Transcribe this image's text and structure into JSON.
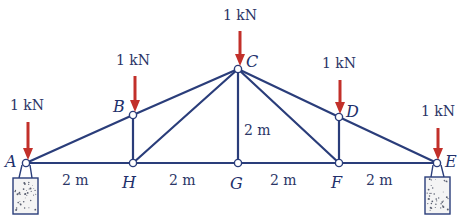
{
  "diagram": {
    "type": "truss",
    "line_color": "#2a3d7a",
    "load_color": "#c2302a",
    "joints": [
      {
        "id": "A",
        "label": "A",
        "x": 26,
        "y": 163,
        "lx": 5,
        "ly": 167
      },
      {
        "id": "B",
        "label": "B",
        "x": 133,
        "y": 115,
        "lx": 113,
        "ly": 112
      },
      {
        "id": "C",
        "label": "C",
        "x": 238,
        "y": 69,
        "lx": 246,
        "ly": 67
      },
      {
        "id": "D",
        "label": "D",
        "x": 339,
        "y": 117,
        "lx": 346,
        "ly": 117
      },
      {
        "id": "E",
        "label": "E",
        "x": 437,
        "y": 163,
        "lx": 445,
        "ly": 167
      },
      {
        "id": "F",
        "label": "F",
        "x": 339,
        "y": 163,
        "lx": 331,
        "ly": 188
      },
      {
        "id": "G",
        "label": "G",
        "x": 238,
        "y": 163,
        "lx": 230,
        "ly": 189
      },
      {
        "id": "H",
        "label": "H",
        "x": 133,
        "y": 163,
        "lx": 122,
        "ly": 188
      }
    ],
    "members": [
      [
        "A",
        "B"
      ],
      [
        "B",
        "C"
      ],
      [
        "C",
        "D"
      ],
      [
        "D",
        "E"
      ],
      [
        "A",
        "H"
      ],
      [
        "H",
        "G"
      ],
      [
        "G",
        "F"
      ],
      [
        "F",
        "E"
      ],
      [
        "B",
        "H"
      ],
      [
        "H",
        "C"
      ],
      [
        "C",
        "G"
      ],
      [
        "C",
        "F"
      ],
      [
        "D",
        "F"
      ]
    ],
    "loads": [
      {
        "joint": "A",
        "label": "1 kN",
        "x": 28,
        "y1": 122,
        "y2": 160,
        "tx": 10,
        "ty": 110
      },
      {
        "joint": "B",
        "label": "1 kN",
        "x": 135,
        "y1": 76,
        "y2": 112,
        "tx": 116,
        "ty": 65
      },
      {
        "joint": "C",
        "label": "1 kN",
        "x": 240,
        "y1": 31,
        "y2": 66,
        "tx": 223,
        "ty": 20
      },
      {
        "joint": "D",
        "label": "1 kN",
        "x": 340,
        "y1": 80,
        "y2": 114,
        "tx": 322,
        "ty": 68
      },
      {
        "joint": "E",
        "label": "1 kN",
        "x": 438,
        "y1": 128,
        "y2": 160,
        "tx": 421,
        "ty": 116
      }
    ],
    "dimensions": [
      {
        "label": "2 m",
        "x": 62,
        "y": 185,
        "note": "A-H"
      },
      {
        "label": "2 m",
        "x": 169,
        "y": 185,
        "note": "H-G"
      },
      {
        "label": "2 m",
        "x": 270,
        "y": 185,
        "note": "G-F"
      },
      {
        "label": "2 m",
        "x": 366,
        "y": 185,
        "note": "F-E"
      },
      {
        "label": "2 m",
        "x": 244,
        "y": 135,
        "note": "G-C height"
      }
    ],
    "supports": [
      {
        "joint": "A",
        "box": {
          "x": 13,
          "y": 178,
          "w": 25,
          "h": 36
        }
      },
      {
        "joint": "E",
        "box": {
          "x": 425,
          "y": 177,
          "w": 25,
          "h": 37
        }
      }
    ]
  }
}
